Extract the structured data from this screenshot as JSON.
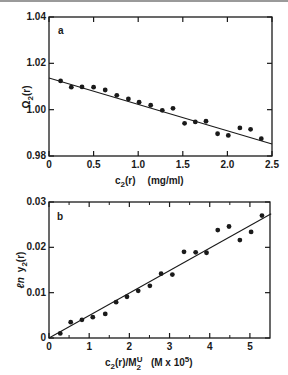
{
  "chart_data": [
    {
      "type": "scatter",
      "panel": "a",
      "title": "",
      "xlabel": "c2(r)   (mg/ml)",
      "ylabel": "Ω2(r)",
      "xlim": [
        0,
        2.5
      ],
      "ylim": [
        0.98,
        1.04
      ],
      "xticks": [
        "0",
        "0.5",
        "1.0",
        "1.5",
        "2.0",
        "2.5"
      ],
      "yticks": [
        "0.98",
        "1.00",
        "1.02",
        "1.04"
      ],
      "grid": false,
      "legend": null,
      "series": [
        {
          "name": "data",
          "marker": "filled-circle",
          "x": [
            0.13,
            0.25,
            0.37,
            0.5,
            0.63,
            0.76,
            0.89,
            1.01,
            1.14,
            1.27,
            1.39,
            1.52,
            1.64,
            1.76,
            1.89,
            2.01,
            2.14,
            2.26,
            2.38
          ],
          "y": [
            1.0124,
            1.0097,
            1.0098,
            1.0097,
            1.0085,
            1.0062,
            1.0046,
            1.0032,
            1.0019,
            0.9997,
            1.0006,
            0.9941,
            0.9947,
            0.995,
            0.9896,
            0.9889,
            0.9921,
            0.9915,
            0.9875
          ]
        },
        {
          "name": "fit",
          "style": "line",
          "x": [
            0,
            2.5
          ],
          "y": [
            1.0137,
            0.9852
          ]
        }
      ]
    },
    {
      "type": "scatter",
      "panel": "b",
      "title": "",
      "xlabel": "c2(r)/M2U   (M x 10^5)",
      "ylabel": "ln y2(r)",
      "xlim": [
        0,
        5.5
      ],
      "ylim": [
        0,
        0.03
      ],
      "xticks": [
        "0",
        "1",
        "2",
        "3",
        "4",
        "5"
      ],
      "yticks": [
        "0",
        "0.01",
        "0.02",
        "0.03"
      ],
      "grid": false,
      "legend": null,
      "series": [
        {
          "name": "data",
          "marker": "filled-circle",
          "x": [
            0.28,
            0.54,
            0.82,
            1.09,
            1.4,
            1.67,
            1.94,
            2.22,
            2.51,
            2.79,
            3.07,
            3.36,
            3.65,
            3.92,
            4.2,
            4.48,
            4.75,
            5.03,
            5.3
          ],
          "y": [
            0.001,
            0.0035,
            0.004,
            0.0046,
            0.0053,
            0.0079,
            0.0091,
            0.0104,
            0.0115,
            0.0142,
            0.014,
            0.019,
            0.0189,
            0.0188,
            0.0238,
            0.0246,
            0.0216,
            0.0234,
            0.027
          ]
        },
        {
          "name": "fit",
          "style": "line",
          "x": [
            0,
            5.53
          ],
          "y": [
            0,
            0.0274
          ]
        }
      ]
    }
  ],
  "panels": {
    "a": {
      "letter": "a",
      "ylabel_main": "Ω",
      "ylabel_sub": "2",
      "ylabel_tail": "(r)",
      "xlabel_main": "c",
      "xlabel_sub": "2",
      "xlabel_tail": "(r)",
      "xlabel_units": "(mg/ml)",
      "frame": {
        "left": 49,
        "right": 272,
        "top": 17,
        "bottom": 156
      },
      "xtick_positions": [
        0,
        0.5,
        1.0,
        1.5,
        2.0,
        2.5
      ],
      "ytick_positions": [
        0.98,
        1.0,
        1.02,
        1.04
      ]
    },
    "b": {
      "letter": "b",
      "ylabel_prefix": "ℓn",
      "ylabel_main": "y",
      "ylabel_sub": "2",
      "ylabel_tail": "(r)",
      "xlabel_main": "c",
      "xlabel_sub": "2",
      "xlabel_mid": "(r)/M",
      "xlabel_sup": "U",
      "xlabel_sub2": "2",
      "xlabel_units_pre": "(M x 10",
      "xlabel_units_sup": "5",
      "xlabel_units_post": ")",
      "frame": {
        "left": 49,
        "right": 270,
        "top": 202,
        "bottom": 338
      },
      "xtick_positions": [
        0,
        1,
        2,
        3,
        4,
        5
      ],
      "minor_xtick_positions": [
        0.5,
        1.5,
        2.5,
        3.5,
        4.5
      ],
      "ytick_positions": [
        0,
        0.01,
        0.02,
        0.03
      ]
    }
  },
  "colors": {
    "ink": "#1a1a1a",
    "background": "#ffffff",
    "top_rule": "#9a9a9a"
  }
}
